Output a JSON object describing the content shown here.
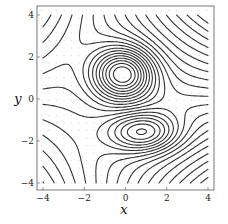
{
  "chart_data": {
    "type": "contour",
    "title": "",
    "xlabel": "x",
    "ylabel": "y",
    "xlim": [
      -4,
      4
    ],
    "ylim": [
      -4,
      4
    ],
    "xticks": [
      -4,
      -2,
      0,
      2,
      4
    ],
    "yticks": [
      -4,
      -2,
      0,
      2,
      4
    ],
    "xtick_labels": [
      "−4",
      "−2",
      "0",
      "2",
      "4"
    ],
    "ytick_labels": [
      "−4",
      "−2",
      "0",
      "2",
      "4"
    ],
    "grid": "faint dotted background grid",
    "legend": null,
    "features": [
      {
        "kind": "maximum",
        "center": [
          -0.1,
          1.2
        ],
        "shape": "nested closed ellipses, about 8 rings"
      },
      {
        "kind": "minimum",
        "center": [
          0.9,
          -1.6
        ],
        "shape": "nested elongated ellipses, tilted, about 4 closed rings"
      }
    ],
    "contour_color": "#333333",
    "approx_function": "f(x,y)=3*exp(-((x+0.1)^2/2.2+(y-1.2)^2/1.6)) - 2*exp(-((x-0.9)^2/2.8+(y+1.6)^2/0.9)) - 0.12*x*y - 0.15*y",
    "num_levels": 22
  }
}
